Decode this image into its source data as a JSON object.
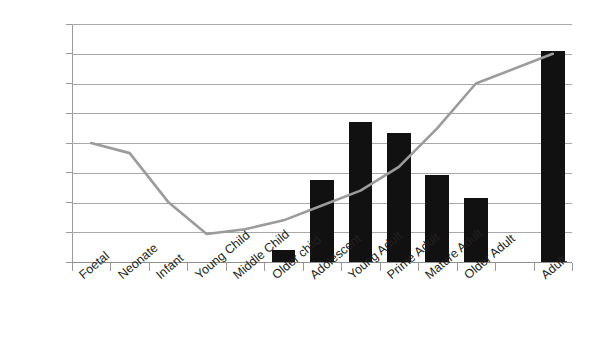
{
  "chart_data": {
    "type": "bar",
    "title": "",
    "subtitle": "",
    "xlabel": "",
    "ylabel": "",
    "ylim": [
      0,
      40
    ],
    "ytick_step": 5,
    "ytick_labels": [
      "0",
      "5",
      "10",
      "15",
      "20",
      "25",
      "30",
      "35",
      "40"
    ],
    "grid": true,
    "legend": "none",
    "categories": [
      "Foetal",
      "Neonate",
      "Infant",
      "Young Child",
      "Middle Child",
      "Older child",
      "Adolescent",
      "Young Adult",
      "Prime Adult",
      "Mature Adult",
      "Older Adult",
      "",
      "Adult"
    ],
    "series": [
      {
        "name": "bars",
        "type": "bar",
        "color": "#111111",
        "values": [
          null,
          null,
          null,
          null,
          null,
          2.0,
          13.8,
          23.6,
          21.7,
          14.7,
          10.7,
          null,
          35.5
        ]
      },
      {
        "name": "line",
        "type": "line",
        "color": "#9b9b9b",
        "values": [
          20.0,
          18.3,
          10.1,
          4.7,
          5.5,
          7.0,
          9.5,
          12.0,
          16.0,
          22.5,
          30.0,
          null,
          35.0
        ]
      }
    ]
  }
}
